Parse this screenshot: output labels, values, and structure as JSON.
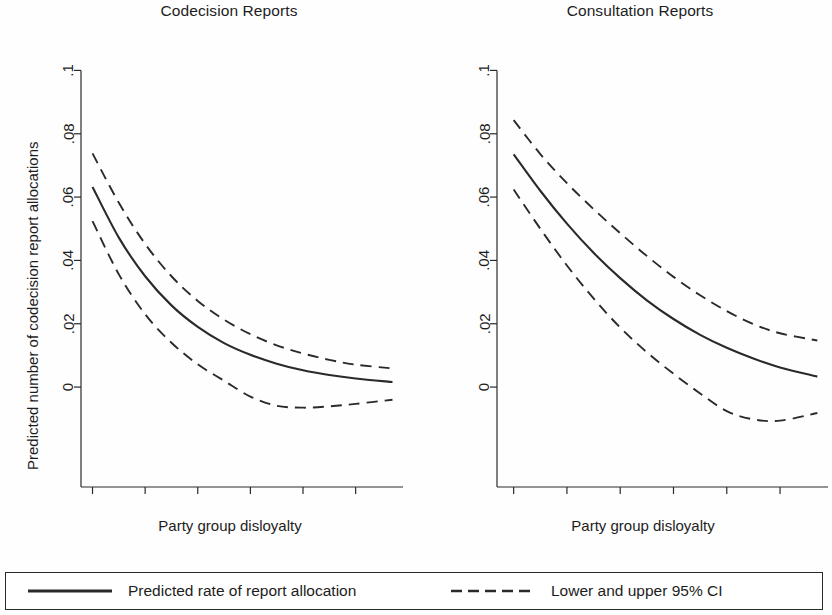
{
  "figure": {
    "background_color": "#fefefe",
    "line_color": "#2a2a2a"
  },
  "legend": {
    "entries": [
      {
        "key": "solid-line-key",
        "label": "Predicted rate of report allocation"
      },
      {
        "key": "dashed-line-key",
        "label": "Lower and upper 95% CI"
      }
    ]
  },
  "chart_data": [
    {
      "type": "line",
      "title": "Codecision Reports",
      "xlabel": "Party group disloyalty",
      "ylabel": "Predicted number of codecision report allocations",
      "xlim": [
        -0.04,
        1.18
      ],
      "ylim": [
        -0.0145,
        0.1055
      ],
      "xticks": [
        0,
        0.2,
        0.4,
        0.6,
        0.8,
        1
      ],
      "xticklabels": [
        "0",
        ".2",
        ".4",
        ".6",
        ".8",
        "1"
      ],
      "yticks": [
        0,
        0.02,
        0.04,
        0.06,
        0.08,
        0.1
      ],
      "yticklabels": [
        "0",
        ".02",
        ".04",
        ".06",
        ".08",
        ".1"
      ],
      "grid": false,
      "legend_position": "below-figure",
      "x": [
        0,
        0.1,
        0.2,
        0.3,
        0.4,
        0.5,
        0.6,
        0.7,
        0.8,
        0.9,
        1.0,
        1.14
      ],
      "series": [
        {
          "name": "Predicted rate of report allocation",
          "style": "solid",
          "values": [
            0.0632,
            0.0472,
            0.035,
            0.0258,
            0.019,
            0.0139,
            0.0102,
            0.0074,
            0.0053,
            0.0038,
            0.0027,
            0.0016
          ]
        },
        {
          "name": "Upper 95% CI",
          "style": "dashed",
          "values": [
            0.0738,
            0.0582,
            0.0452,
            0.035,
            0.0272,
            0.0213,
            0.0167,
            0.0132,
            0.0106,
            0.0086,
            0.0071,
            0.0059
          ]
        },
        {
          "name": "Lower 95% CI",
          "style": "dashed",
          "values": [
            0.0524,
            0.0356,
            0.023,
            0.014,
            0.0072,
            0.002,
            -0.003,
            -0.0059,
            -0.0065,
            -0.0061,
            -0.0053,
            -0.004
          ]
        }
      ]
    },
    {
      "type": "line",
      "title": "Consultation Reports",
      "xlabel": "Party group disloyalty",
      "ylabel": "Predicted number of consultation report allocations",
      "xlim": [
        -0.04,
        1.18
      ],
      "ylim": [
        -0.0145,
        0.1055
      ],
      "xticks": [
        0,
        0.2,
        0.4,
        0.6,
        0.8,
        1
      ],
      "xticklabels": [
        "0",
        ".2",
        ".4",
        ".6",
        ".8",
        "1"
      ],
      "yticks": [
        0,
        0.02,
        0.04,
        0.06,
        0.08,
        0.1
      ],
      "yticklabels": [
        "0",
        ".02",
        ".04",
        ".06",
        ".08",
        ".1"
      ],
      "grid": false,
      "legend_position": "below-figure",
      "x": [
        0,
        0.1,
        0.2,
        0.3,
        0.4,
        0.5,
        0.6,
        0.7,
        0.8,
        0.9,
        1.0,
        1.14
      ],
      "series": [
        {
          "name": "Predicted rate of report allocation",
          "style": "solid",
          "values": [
            0.0735,
            0.062,
            0.0516,
            0.0424,
            0.0344,
            0.0274,
            0.0215,
            0.0165,
            0.0124,
            0.009,
            0.0062,
            0.0033
          ]
        },
        {
          "name": "Upper 95% CI",
          "style": "dashed",
          "values": [
            0.0843,
            0.0736,
            0.0644,
            0.0562,
            0.0486,
            0.0414,
            0.0348,
            0.029,
            0.024,
            0.0199,
            0.017,
            0.0147
          ]
        },
        {
          "name": "Lower 95% CI",
          "style": "dashed",
          "values": [
            0.0624,
            0.05,
            0.0384,
            0.028,
            0.0188,
            0.011,
            0.0042,
            -0.002,
            -0.0076,
            -0.0102,
            -0.0106,
            -0.0082
          ]
        }
      ]
    }
  ]
}
